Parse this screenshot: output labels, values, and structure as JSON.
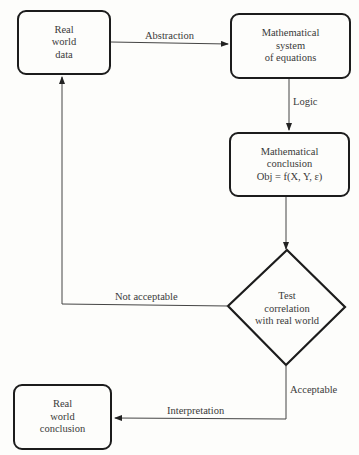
{
  "nodes": {
    "real_world_data": {
      "lines": [
        "Real",
        "world",
        "data"
      ]
    },
    "math_system": {
      "lines": [
        "Mathematical",
        "system",
        "of equations"
      ]
    },
    "math_conclusion": {
      "lines": [
        "Mathematical",
        "conclusion",
        "Obj = f(X, Y, ε)"
      ]
    },
    "test_correlation": {
      "lines": [
        "Test",
        "correlation",
        "with real world"
      ]
    },
    "real_world_conclusion": {
      "lines": [
        "Real",
        "world",
        "conclusion"
      ]
    }
  },
  "edges": {
    "abstraction": "Abstraction",
    "logic": "Logic",
    "not_acceptable": "Not acceptable",
    "acceptable": "Acceptable",
    "interpretation": "Interpretation"
  }
}
